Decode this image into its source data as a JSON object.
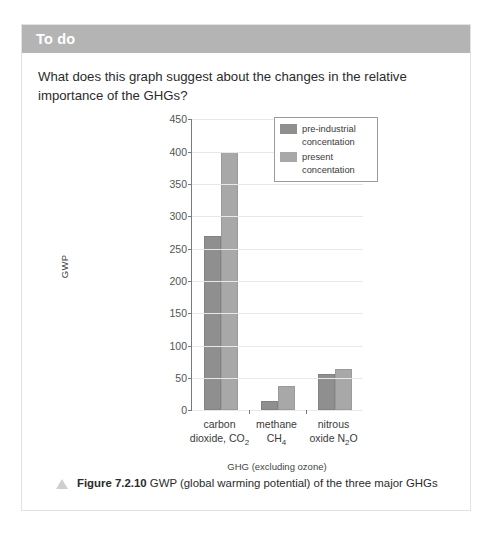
{
  "panel": {
    "header_title": "To do",
    "question": "What does this graph suggest about the changes in the relative importance of the GHGs?"
  },
  "caption": {
    "figure_number": "Figure 7.2.10",
    "text": " GWP (global warming potential) of the three major GHGs",
    "marker_icon": "triangle-icon"
  },
  "chart_data": {
    "type": "bar",
    "title": "",
    "xlabel": "GHG (excluding ozone)",
    "ylabel": "GWP",
    "ylim": [
      0,
      450
    ],
    "yticks": [
      0,
      50,
      100,
      150,
      200,
      250,
      300,
      350,
      400,
      450
    ],
    "grid": true,
    "legend_position": "top-right",
    "categories": [
      "carbon dioxide, CO2",
      "methane CH4",
      "nitrous oxide N2O"
    ],
    "category_labels": [
      {
        "line1": "carbon",
        "line2": "dioxide, CO",
        "sub": "2",
        "tail": ""
      },
      {
        "line1": "methane",
        "line2": "CH",
        "sub": "4",
        "tail": ""
      },
      {
        "line1": "nitrous",
        "line2": "oxide N",
        "sub": "2",
        "tail": "O"
      }
    ],
    "series": [
      {
        "name": "pre-industrial concentation",
        "color": "#8f8f8f",
        "values": [
          270,
          15,
          56
        ]
      },
      {
        "name": "present concentation",
        "color": "#a8a8a8",
        "values": [
          400,
          37,
          64
        ]
      }
    ]
  }
}
